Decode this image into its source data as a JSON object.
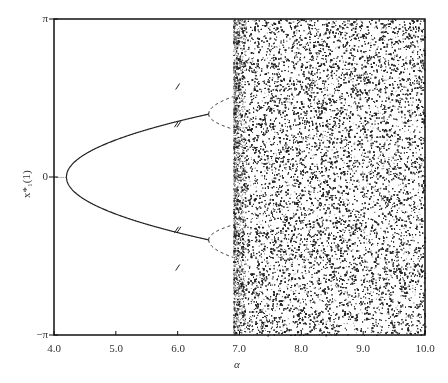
{
  "chart_data": {
    "type": "scatter",
    "title": "",
    "xlabel": "α",
    "ylabel": "x*₁(1)",
    "xlim": [
      4.0,
      10.0
    ],
    "ylim": [
      "-π",
      "π"
    ],
    "x_ticks": [
      "4.0",
      "5.0",
      "6.0",
      "7.0",
      "8.0",
      "9.0",
      "10.0"
    ],
    "y_ticks": [
      "π",
      "0",
      "-π"
    ],
    "grid": false,
    "legend": null,
    "branches": {
      "pitchfork_start_alpha": 4.2,
      "upper_branch": [
        [
          4.2,
          0.0
        ],
        [
          4.5,
          0.45
        ],
        [
          5.0,
          0.75
        ],
        [
          5.5,
          0.95
        ],
        [
          6.0,
          1.1
        ],
        [
          6.5,
          1.2
        ]
      ],
      "lower_branch": [
        [
          4.2,
          0.0
        ],
        [
          4.5,
          -0.45
        ],
        [
          5.0,
          -0.75
        ],
        [
          5.5,
          -0.95
        ],
        [
          6.0,
          -1.1
        ],
        [
          6.5,
          -1.2
        ]
      ],
      "chaos_onset_alpha": 6.9
    }
  },
  "axes": {
    "y_top": "π",
    "y_zero": "0",
    "y_bottom": "−π",
    "x_ticks": [
      "4.0",
      "5.0",
      "6.0",
      "7.0",
      "8.0",
      "9.0",
      "10.0"
    ],
    "xlabel": "α",
    "ylabel": "x*₁(1)"
  }
}
